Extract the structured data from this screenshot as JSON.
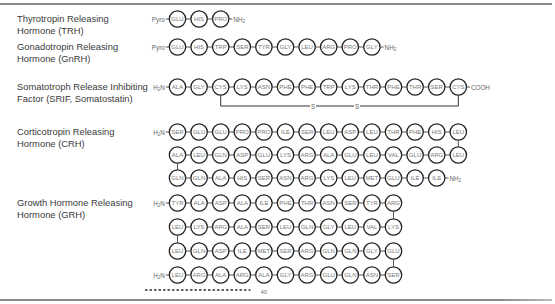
{
  "hormones": [
    {
      "id": "trh",
      "label_lines": [
        "Thyrotropin Releasing",
        "Hormone (TRH)"
      ],
      "rows": [
        {
          "prefix": "Pyro",
          "residues": [
            "GLU",
            "HIS",
            "PRO"
          ],
          "suffix": "NH2"
        }
      ]
    },
    {
      "id": "gnrh",
      "label_lines": [
        "Gonadotropin Releasing",
        "Hormone (GnRH)"
      ],
      "rows": [
        {
          "prefix": "Pyro",
          "residues": [
            "GLU",
            "HIS",
            "TRP",
            "SER",
            "TYR",
            "GLY",
            "LEU",
            "ARG",
            "PRO",
            "GLY"
          ],
          "suffix": "NH2"
        }
      ]
    },
    {
      "id": "srif",
      "label_lines": [
        "Somatotroph Release Inhibiting",
        "Factor (SRIF, Somatostatin)"
      ],
      "rows": [
        {
          "prefix": "H2N",
          "residues": [
            "ALA",
            "GLY",
            "CYS",
            "LYS",
            "ASN",
            "PHE",
            "PHE",
            "TRP",
            "LYS",
            "THR",
            "PHE",
            "THR",
            "SER",
            "CYS"
          ],
          "suffix": "COOH"
        }
      ],
      "disulfide": {
        "from_residue_index": 2,
        "to_residue_index": 13,
        "labels": [
          "S",
          "S"
        ]
      }
    },
    {
      "id": "crh",
      "label_lines": [
        "Corticotropin Releasing",
        "Hormone (CRH)"
      ],
      "rows": [
        {
          "prefix": "H2N",
          "residues": [
            "SER",
            "GLU",
            "GLU",
            "PRO",
            "PRO",
            "ILE",
            "SER",
            "LEU",
            "ASP",
            "LEU",
            "THR",
            "PHE",
            "HIS",
            "LEU"
          ],
          "suffix": ""
        },
        {
          "prefix": "",
          "residues": [
            "ALA",
            "LEU",
            "GLN",
            "ASP",
            "GLU",
            "LYS",
            "ARG",
            "ALA",
            "GLU",
            "LEU",
            "VAL",
            "GLU",
            "ARG",
            "LEU"
          ],
          "suffix": ""
        },
        {
          "prefix": "",
          "residues": [
            "GLN",
            "GLN",
            "ALA",
            "HIS",
            "SER",
            "ASN",
            "ARG",
            "LYS",
            "LEU",
            "MET",
            "GLU",
            "ILE",
            "ILE"
          ],
          "suffix": "NH2"
        }
      ]
    },
    {
      "id": "grh",
      "label_lines": [
        "Growth Hormone Releasing",
        "Hormone (GRH)"
      ],
      "rows": [
        {
          "prefix": "H2N",
          "residues": [
            "TYR",
            "ALA",
            "ASP",
            "ALA",
            "ILE",
            "PHE",
            "THR",
            "ASN",
            "SER",
            "TYR",
            "ARG"
          ],
          "suffix": ""
        },
        {
          "prefix": "",
          "residues": [
            "LEU",
            "LYS",
            "ARG",
            "ALA",
            "SER",
            "LEU",
            "GLN",
            "GLY",
            "LEU",
            "VAL",
            "LYS"
          ],
          "suffix": ""
        },
        {
          "prefix": "",
          "residues": [
            "LEU",
            "GLN",
            "ASP",
            "ILE",
            "MET",
            "SER",
            "ARG",
            "GLN",
            "GLN",
            "GLY",
            "GLU"
          ],
          "suffix": ""
        },
        {
          "prefix": "H2N",
          "residues": [
            "LEU",
            "ARG",
            "ALA",
            "ARG",
            "ALA",
            "GLY",
            "ARG",
            "GLU",
            "GLN",
            "ASN",
            "SER"
          ],
          "suffix": ""
        }
      ],
      "position_marker": "40"
    }
  ]
}
